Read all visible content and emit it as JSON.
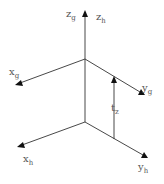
{
  "diagram": {
    "colors": {
      "line": "#333333",
      "arrow": "#111111",
      "text": "#555555",
      "background": "#ffffff"
    },
    "labels": {
      "z_g": {
        "base": "z",
        "sub": "g"
      },
      "z_h": {
        "base": "z",
        "sub": "h"
      },
      "x_g": {
        "base": "x",
        "sub": "g"
      },
      "y_g": {
        "base": "y",
        "sub": "g"
      },
      "t_z": {
        "base": "t",
        "sub": "z"
      },
      "x_h": {
        "base": "x",
        "sub": "h"
      },
      "y_h": {
        "base": "y",
        "sub": "h"
      }
    },
    "frames": [
      {
        "name": "g",
        "origin": [
          85,
          59
        ],
        "axes": [
          "x_g",
          "y_g",
          "z_g"
        ]
      },
      {
        "name": "h",
        "origin": [
          85,
          122
        ],
        "axes": [
          "x_h",
          "y_h",
          "z_h"
        ]
      }
    ],
    "translation": {
      "label": "t_z",
      "from": [
        114,
        139
      ],
      "to": [
        114,
        77
      ]
    }
  }
}
